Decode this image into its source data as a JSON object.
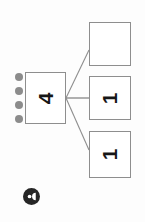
{
  "diagram": {
    "type": "tree",
    "orientation": "rotated-90-ccw",
    "background_color": "#fdfdfd",
    "node_border_color": "#8e8e8e",
    "node_fill_color": "#ffffff",
    "connector_color": "#8e8e8e",
    "handle_dot_color": "#8c8c8c",
    "avatar_color": "#262626",
    "root": {
      "label": "4",
      "name": "root-node"
    },
    "children": [
      {
        "label": "",
        "name": "child-node-empty"
      },
      {
        "label": "1",
        "name": "child-node-one-a"
      },
      {
        "label": "1",
        "name": "child-node-one-b"
      }
    ],
    "handle": {
      "name": "drag-handle",
      "dot_count": 4
    },
    "avatar": {
      "name": "avatar-icon",
      "glyph": "user-icon"
    }
  }
}
